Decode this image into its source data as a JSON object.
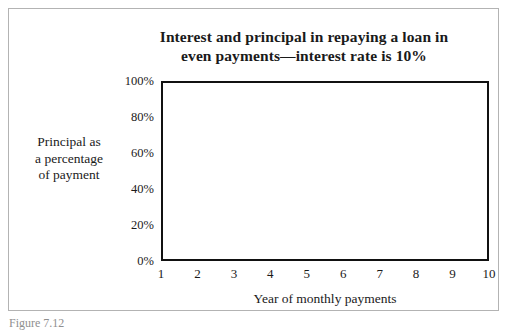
{
  "figure": {
    "caption": "Figure 7.12"
  },
  "chart_data": {
    "type": "area",
    "title": "Interest and principal in repaying a loan in even payments—interest rate is 10%",
    "title_lines": [
      "Interest and principal in repaying a loan in",
      "even payments—interest rate is 10%"
    ],
    "xlabel": "Year of monthly payments",
    "ylabel": "Principal as a percentage of payment",
    "ylabel_lines": [
      "Principal as",
      "a percentage",
      "of payment"
    ],
    "x": [
      1,
      2,
      3,
      4,
      5,
      6,
      7,
      8,
      9,
      10
    ],
    "xtick_labels": [
      "1",
      "2",
      "3",
      "4",
      "5",
      "6",
      "7",
      "8",
      "9",
      "10"
    ],
    "xlim": [
      1,
      10
    ],
    "ylim": [
      0,
      100
    ],
    "yticks": [
      0,
      20,
      40,
      60,
      80,
      100
    ],
    "ytick_labels": [
      "0%",
      "20%",
      "40%",
      "60%",
      "80%",
      "100%"
    ],
    "grid": false,
    "legend_position": "in-plot-annotations",
    "series": [
      {
        "name": "Principal",
        "label": "Principal",
        "fill": "checkerboard-gray-50",
        "values": [
          39,
          43,
          47.5,
          52.5,
          58,
          64,
          71,
          78.5,
          87,
          96
        ]
      },
      {
        "name": "Interest",
        "label": "Interest",
        "fill": "white",
        "values": [
          61,
          57,
          52.5,
          47.5,
          42,
          36,
          29,
          21.5,
          13,
          4
        ]
      }
    ],
    "annotations": [
      {
        "text": "Interest",
        "x": 1.9,
        "y": 84
      },
      {
        "text": "Principal",
        "x": 6.3,
        "y": 33
      }
    ],
    "colors": {
      "axis": "#111111",
      "curve": "#111111",
      "principal_fill": "#808080",
      "interest_fill": "#ffffff",
      "frame": "#b3b3b3",
      "text": "#1a1a1a"
    }
  }
}
